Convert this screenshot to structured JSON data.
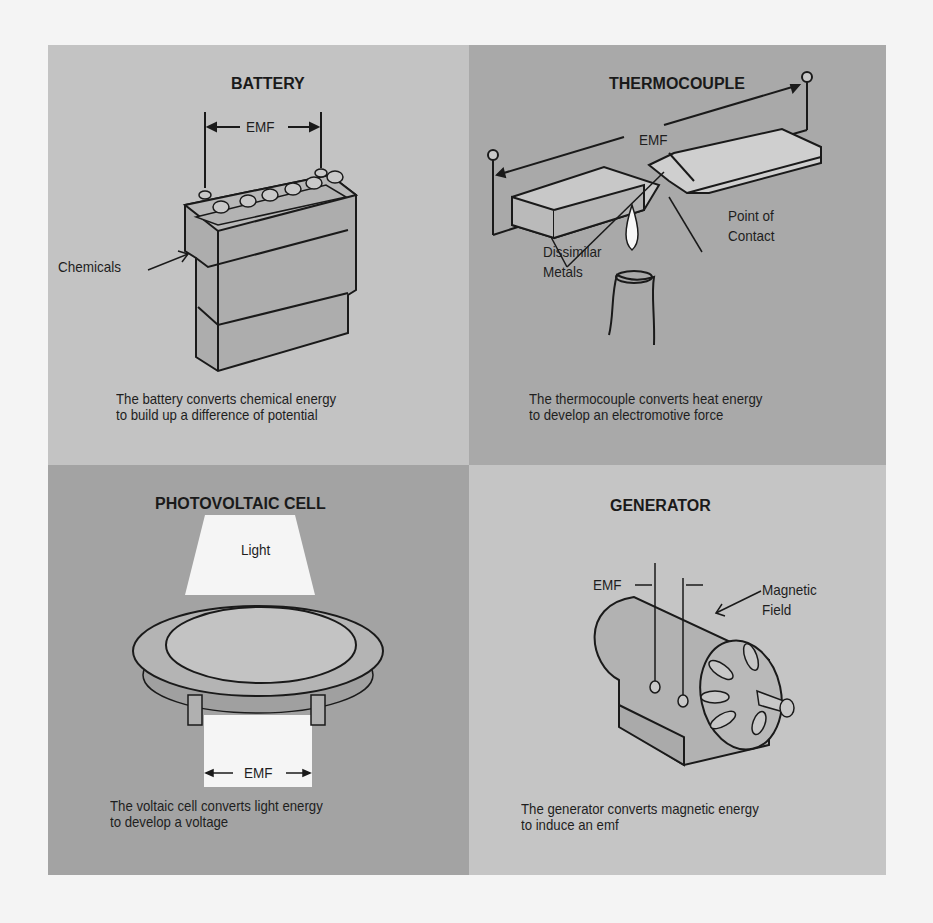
{
  "panels": {
    "battery": {
      "title": "BATTERY",
      "emf_label": "EMF",
      "chemicals_label": "Chemicals",
      "caption_line1": "The battery converts chemical energy",
      "caption_line2": "to build up a difference of potential",
      "background": "#c3c3c3"
    },
    "thermocouple": {
      "title": "THERMOCOUPLE",
      "emf_label": "EMF",
      "dissimilar_label_line1": "Dissimilar",
      "dissimilar_label_line2": "Metals",
      "contact_label_line1": "Point of",
      "contact_label_line2": "Contact",
      "caption_line1": "The thermocouple converts heat energy",
      "caption_line2": "to develop an electromotive force",
      "background": "#a9a9a9"
    },
    "photovoltaic": {
      "title": "PHOTOVOLTAIC  CELL",
      "light_label": "Light",
      "emf_label": "EMF",
      "caption_line1": "The voltaic cell converts light energy",
      "caption_line2": "to develop a voltage",
      "background": "#a3a3a3"
    },
    "generator": {
      "title": "GENERATOR",
      "emf_label": "EMF",
      "field_label_line1": "Magnetic",
      "field_label_line2": "Field",
      "caption_line1": "The generator  converts  magnetic energy",
      "caption_line2": "to induce an emf",
      "background": "#c5c5c5"
    }
  }
}
